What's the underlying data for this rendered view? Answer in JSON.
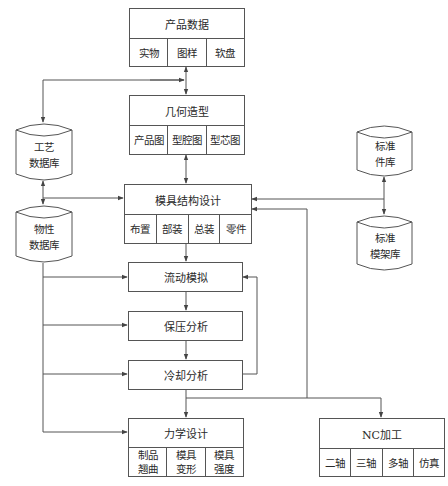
{
  "diagram": {
    "type": "flowchart",
    "nodes": {
      "product_data": {
        "title": "产品数据",
        "cells": [
          "实物",
          "图样",
          "软盘"
        ]
      },
      "geometry": {
        "title": "几何造型",
        "cells": [
          "产品图",
          "型腔图",
          "型芯图"
        ]
      },
      "process_db": {
        "label": "工艺\n数据库"
      },
      "property_db": {
        "label": "物性\n数据库"
      },
      "mold_design": {
        "title": "模具结构设计",
        "cells": [
          "布置",
          "部装",
          "总装",
          "零件"
        ]
      },
      "std_parts_db": {
        "label": "标准\n件库"
      },
      "std_frame_db": {
        "label": "标准\n模架库"
      },
      "flow_sim": {
        "title": "流动模拟"
      },
      "packing": {
        "title": "保压分析"
      },
      "cooling": {
        "title": "冷却分析"
      },
      "mechanics": {
        "title": "力学设计",
        "cells": [
          "制品\n翘曲",
          "模具\n变形",
          "模具\n强度"
        ]
      },
      "nc": {
        "title": "NC加工",
        "cells": [
          "二轴",
          "三轴",
          "多轴",
          "仿真"
        ]
      }
    },
    "edges": [
      [
        "product_data",
        "geometry",
        "bidirectional"
      ],
      [
        "product_data/geometry link",
        "process_db"
      ],
      [
        "process_db",
        "property_db",
        "bidirectional"
      ],
      [
        "process_db/property_db link",
        "mold_design"
      ],
      [
        "geometry",
        "mold_design",
        "bidirectional"
      ],
      [
        "std_parts_db",
        "mold_design"
      ],
      [
        "std_parts_db",
        "std_frame_db",
        "bidirectional"
      ],
      [
        "mold_design",
        "flow_sim"
      ],
      [
        "property_db",
        "flow_sim"
      ],
      [
        "property_db",
        "packing"
      ],
      [
        "property_db",
        "cooling"
      ],
      [
        "property_db",
        "mechanics"
      ],
      [
        "flow_sim",
        "packing"
      ],
      [
        "packing",
        "cooling"
      ],
      [
        "cooling",
        "flow_sim",
        "feedback"
      ],
      [
        "cooling",
        "mechanics"
      ],
      [
        "cooling",
        "nc"
      ],
      [
        "cooling",
        "mold_design",
        "feedback"
      ]
    ],
    "line_color": "#555555"
  }
}
